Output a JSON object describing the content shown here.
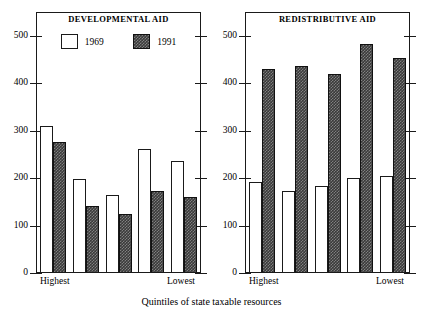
{
  "figure": {
    "axis_caption": "Quintiles of state taxable resources"
  },
  "panels": [
    {
      "id": "developmental",
      "title": "DEVELOPMENTAL AID",
      "x_left_label": "Highest",
      "x_right_label": "Lowest",
      "legend": [
        {
          "label": "1969",
          "style": "open"
        },
        {
          "label": "1991",
          "style": "filled"
        }
      ]
    },
    {
      "id": "redistributive",
      "title": "REDISTRIBUTIVE AID",
      "x_left_label": "Highest",
      "x_right_label": "Lowest"
    }
  ],
  "axis": {
    "y_ticks": [
      "0",
      "100",
      "200",
      "300",
      "400",
      "500"
    ],
    "y_min": 0,
    "y_max": 550
  },
  "colors": {
    "bar_1969_fill": "#ffffff",
    "bar_1991_fill": "#3a3a3a",
    "frame": "#1a1a1a",
    "background": "#ffffff"
  },
  "chart_data": [
    {
      "type": "bar",
      "title": "DEVELOPMENTAL AID",
      "xlabel": "Quintiles of state taxable resources",
      "ylabel": "",
      "categories": [
        "Highest",
        "2nd",
        "3rd",
        "4th",
        "Lowest"
      ],
      "series": [
        {
          "name": "1969",
          "values": [
            307,
            197,
            163,
            260,
            234
          ]
        },
        {
          "name": "1991",
          "values": [
            275,
            140,
            122,
            170,
            159
          ]
        }
      ],
      "ylim": [
        0,
        550
      ],
      "yticks": [
        0,
        100,
        200,
        300,
        400,
        500
      ],
      "grid": false,
      "legend": "inside-top"
    },
    {
      "type": "bar",
      "title": "REDISTRIBUTIVE AID",
      "xlabel": "Quintiles of state taxable resources",
      "ylabel": "",
      "categories": [
        "Highest",
        "2nd",
        "3rd",
        "4th",
        "Lowest"
      ],
      "series": [
        {
          "name": "1969",
          "values": [
            190,
            170,
            182,
            198,
            203
          ]
        },
        {
          "name": "1991",
          "values": [
            428,
            435,
            417,
            480,
            452
          ]
        }
      ],
      "ylim": [
        0,
        550
      ],
      "yticks": [
        0,
        100,
        200,
        300,
        400,
        500
      ],
      "grid": false,
      "legend": "none"
    }
  ]
}
